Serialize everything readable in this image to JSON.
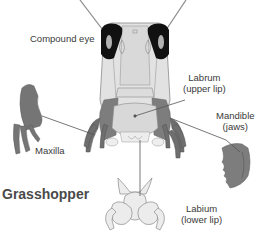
{
  "diagram": {
    "title": "Grasshopper",
    "colors": {
      "head_fill": "#e2e2e2",
      "head_stroke": "#8a8a8a",
      "eye_fill": "#111111",
      "appendage_fill": "#7d7d7d",
      "appendage_dark": "#5f5f5f",
      "leader_line": "#555555",
      "label_text": "#3a3a3a"
    },
    "labels": {
      "compound_eye": "Compound eye",
      "labrum_line1": "Labrum",
      "labrum_line2": "(upper lip)",
      "mandible_line1": "Mandible",
      "mandible_line2": "(jaws)",
      "maxilla": "Maxilla",
      "labium_line1": "Labium",
      "labium_line2": "(lower lip)"
    }
  }
}
